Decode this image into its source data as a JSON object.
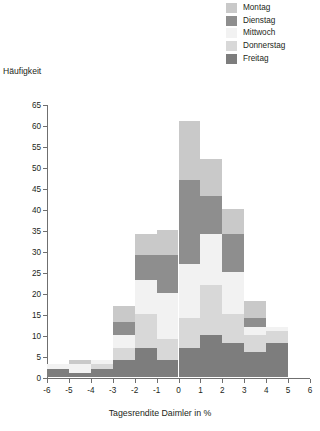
{
  "chart_data": {
    "type": "bar",
    "subtype": "stacked-histogram",
    "title": "",
    "xlabel": "Tagesrendite Daimler in %",
    "ylabel": "Häufigkeit",
    "xlim": [
      -6,
      6
    ],
    "ylim": [
      0,
      65
    ],
    "xticks": [
      "-6",
      "-5",
      "-4",
      "-3",
      "-2",
      "-1",
      "0",
      "1",
      "2",
      "3",
      "4",
      "5",
      "6"
    ],
    "yticks": [
      "0",
      "5",
      "10",
      "15",
      "20",
      "25",
      "30",
      "35",
      "40",
      "45",
      "50",
      "55",
      "60",
      "65"
    ],
    "grid": false,
    "legend_position": "top-right",
    "bin_labels": [
      "-6 to -5",
      "-5 to -4",
      "-4 to -3",
      "-3 to -2",
      "-2 to -1",
      "-1 to 0",
      "0 to 1",
      "1 to 2",
      "2 to 3",
      "3 to 4",
      "4 to 5"
    ],
    "bin_starts": [
      -6,
      -5,
      -4,
      -3,
      -2,
      -1,
      0,
      1,
      2,
      3,
      4
    ],
    "series": [
      {
        "name": "Montag",
        "color": "#c9c9c9",
        "values": [
          0,
          1,
          0,
          4,
          5,
          6,
          14,
          9,
          6,
          4,
          0
        ]
      },
      {
        "name": "Dienstag",
        "color": "#8e8e8e",
        "values": [
          0,
          0,
          0,
          3,
          6,
          9,
          20,
          9,
          9,
          2,
          0
        ]
      },
      {
        "name": "Mittwoch",
        "color": "#f2f2f2",
        "values": [
          1,
          2,
          1,
          3,
          8,
          11,
          13,
          12,
          10,
          2,
          1
        ]
      },
      {
        "name": "Donnerstag",
        "color": "#d8d8d8",
        "values": [
          0,
          0,
          1,
          3,
          8,
          5,
          7,
          12,
          7,
          4,
          3
        ]
      },
      {
        "name": "Freitag",
        "color": "#7d7d7d",
        "values": [
          2,
          1,
          2,
          4,
          7,
          4,
          7,
          10,
          8,
          6,
          8
        ]
      }
    ],
    "totals": [
      3,
      4,
      4,
      17,
      34,
      35,
      61,
      52,
      40,
      18,
      12
    ]
  },
  "legend": {
    "items": [
      {
        "label": "Montag"
      },
      {
        "label": "Dienstag"
      },
      {
        "label": "Mittwoch"
      },
      {
        "label": "Donnerstag"
      },
      {
        "label": "Freitag"
      }
    ]
  }
}
